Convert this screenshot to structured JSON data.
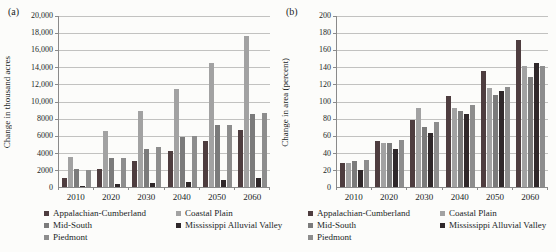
{
  "legend": {
    "items": [
      {
        "label": "Appalachian-Cumberland",
        "color": "#4e3d3f"
      },
      {
        "label": "Coastal Plain",
        "color": "#a2a2a2"
      },
      {
        "label": "Mid-South",
        "color": "#7b7b7b"
      },
      {
        "label": "Mississippi Alluvial Valley",
        "color": "#2f282a"
      },
      {
        "label": "Piedmont",
        "color": "#8d8d8d"
      }
    ],
    "columns": [
      [
        0,
        2,
        4
      ],
      [
        1,
        3
      ]
    ]
  },
  "colors": {
    "axis": "#8a8a8a",
    "gridline": "#c2c2c0",
    "background": "#fcfcfa"
  },
  "chart_data": [
    {
      "type": "bar",
      "panel_label": "(a)",
      "title": "",
      "xlabel": "",
      "ylabel": "Change in thousand acres",
      "grid": true,
      "legend_position": "bottom",
      "ylim": [
        0,
        20000
      ],
      "ytick_labels": [
        "0",
        "2000",
        "4000",
        "6000",
        "8000",
        "10,000",
        "12,000",
        "14,000",
        "16,000",
        "18,000",
        "20,000"
      ],
      "categories": [
        "2010",
        "2020",
        "2030",
        "2040",
        "2050",
        "2060"
      ],
      "series": [
        {
          "name": "Appalachian-Cumberland",
          "color": "#4e3d3f",
          "values": [
            1100,
            2100,
            3000,
            4200,
            5400,
            6700
          ]
        },
        {
          "name": "Coastal Plain",
          "color": "#a2a2a2",
          "values": [
            3500,
            6500,
            8900,
            11500,
            14500,
            17700
          ]
        },
        {
          "name": "Mid-South",
          "color": "#7b7b7b",
          "values": [
            2100,
            3400,
            4500,
            5900,
            7200,
            8500
          ]
        },
        {
          "name": "Mississippi Alluvial Valley",
          "color": "#2f282a",
          "values": [
            150,
            300,
            450,
            600,
            800,
            1050
          ]
        },
        {
          "name": "Piedmont",
          "color": "#8d8d8d",
          "values": [
            2000,
            3400,
            4700,
            6000,
            7200,
            8700
          ]
        }
      ]
    },
    {
      "type": "bar",
      "panel_label": "(b)",
      "title": "",
      "xlabel": "",
      "ylabel": "Change in area (percent)",
      "grid": true,
      "legend_position": "bottom",
      "ylim": [
        0,
        200
      ],
      "ytick_labels": [
        "0",
        "20",
        "40",
        "60",
        "80",
        "100",
        "120",
        "140",
        "160",
        "180",
        "200"
      ],
      "categories": [
        "2010",
        "2020",
        "2030",
        "2040",
        "2050",
        "2060"
      ],
      "series": [
        {
          "name": "Appalachian-Cumberland",
          "color": "#4e3d3f",
          "values": [
            28,
            54,
            78,
            106,
            136,
            172
          ]
        },
        {
          "name": "Coastal Plain",
          "color": "#a2a2a2",
          "values": [
            28,
            52,
            92,
            92,
            116,
            142
          ]
        },
        {
          "name": "Mid-South",
          "color": "#7b7b7b",
          "values": [
            31,
            51,
            70,
            89,
            108,
            129
          ]
        },
        {
          "name": "Mississippi Alluvial Valley",
          "color": "#2f282a",
          "values": [
            20,
            44,
            63,
            85,
            112,
            145
          ]
        },
        {
          "name": "Piedmont",
          "color": "#8d8d8d",
          "values": [
            32,
            55,
            76,
            96,
            117,
            141
          ]
        }
      ]
    }
  ]
}
